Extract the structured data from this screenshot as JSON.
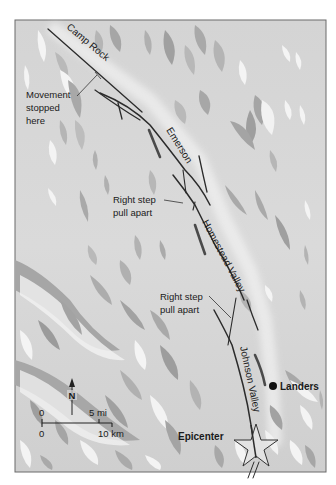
{
  "map": {
    "title": "Landers earthquake fault rupture map",
    "fault_labels": [
      {
        "id": "camp-rock",
        "text": "Camp Rock"
      },
      {
        "id": "emerson",
        "text": "Emerson"
      },
      {
        "id": "homestead-valley",
        "text": "Homestead Valley"
      },
      {
        "id": "johnson-valley",
        "text": "Johnson Valley"
      }
    ],
    "annotations": {
      "movement_stopped": [
        "Movement",
        "stopped",
        "here"
      ],
      "right_step_1": [
        "Right step",
        "pull apart"
      ],
      "right_step_2": [
        "Right step",
        "pull apart"
      ]
    },
    "places": {
      "landers": "Landers",
      "epicenter": "Epicenter"
    },
    "compass": {
      "label": "N"
    },
    "scale_bar": {
      "mi_zero": "0",
      "mi_label": "5 mi",
      "km_zero": "0",
      "km_label": "10 km"
    },
    "colors": {
      "background": "#d6d6d6",
      "frame": "#6a6a6a",
      "fault": "#2b2b2b",
      "relief_dark": "#9a9a9a",
      "relief_mid": "#b5b5b5",
      "relief_light": "#f2f2f2"
    }
  }
}
